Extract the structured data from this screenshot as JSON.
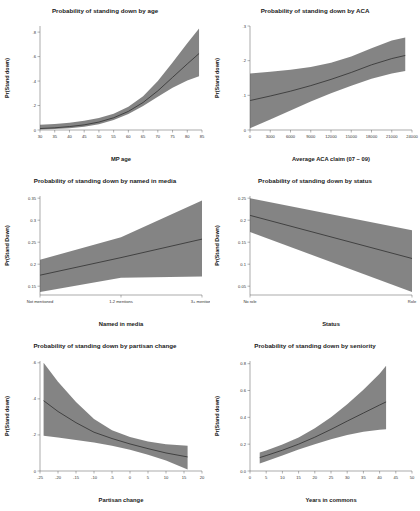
{
  "figure": {
    "background": "#ffffff",
    "band_color": "#7a7a7a",
    "line_color": "#2b2b2b",
    "axis_color": "#555555"
  },
  "chart_data": [
    {
      "id": "age",
      "type": "line",
      "title": "Probability of standing down by age",
      "xlabel": "MP age",
      "ylabel": "Pr(Stand down)",
      "xlim": [
        30,
        85
      ],
      "ylim": [
        0,
        0.85
      ],
      "xticks": [
        30,
        35,
        40,
        45,
        50,
        55,
        60,
        65,
        70,
        75,
        80,
        85
      ],
      "xticklabels": [
        "30",
        "35",
        "40",
        "45",
        "50",
        "55",
        "60",
        "65",
        "70",
        "75",
        "80",
        "85"
      ],
      "yticks": [
        0,
        0.2,
        0.4,
        0.6,
        0.8
      ],
      "yticklabels": [
        "0",
        ".2",
        ".4",
        ".6",
        ".8"
      ],
      "grid": false,
      "legend": "none",
      "x": [
        30,
        35,
        40,
        45,
        50,
        55,
        60,
        65,
        70,
        75,
        80,
        84
      ],
      "fit": [
        0.012,
        0.018,
        0.028,
        0.042,
        0.065,
        0.1,
        0.152,
        0.225,
        0.32,
        0.43,
        0.54,
        0.625
      ],
      "lower": [
        0.004,
        0.008,
        0.015,
        0.027,
        0.048,
        0.082,
        0.13,
        0.196,
        0.272,
        0.345,
        0.405,
        0.44
      ],
      "upper": [
        0.042,
        0.05,
        0.06,
        0.075,
        0.098,
        0.133,
        0.19,
        0.275,
        0.4,
        0.552,
        0.71,
        0.83
      ]
    },
    {
      "id": "aca",
      "type": "line",
      "title": "Probability of standing down by ACA",
      "xlabel": "Average ACA claim (07 − 09)",
      "ylabel": "Pr(Stand down)",
      "xlim": [
        0,
        24000
      ],
      "ylim": [
        0,
        0.3
      ],
      "xticks": [
        0,
        3000,
        6000,
        9000,
        12000,
        15000,
        18000,
        21000,
        24000
      ],
      "xticklabels": [
        "0",
        "3000",
        "6000",
        "9000",
        "12000",
        "15000",
        "18000",
        "21000",
        "24000"
      ],
      "yticks": [
        0,
        0.1,
        0.2,
        0.3
      ],
      "yticklabels": [
        "0",
        ".1",
        ".2",
        ".3"
      ],
      "grid": false,
      "legend": "none",
      "x": [
        0,
        3000,
        6000,
        9000,
        12000,
        15000,
        18000,
        21000,
        23000
      ],
      "fit": [
        0.085,
        0.098,
        0.112,
        0.128,
        0.146,
        0.166,
        0.188,
        0.206,
        0.215
      ],
      "lower": [
        0.005,
        0.03,
        0.056,
        0.082,
        0.106,
        0.128,
        0.148,
        0.163,
        0.17
      ],
      "upper": [
        0.163,
        0.168,
        0.174,
        0.182,
        0.194,
        0.212,
        0.236,
        0.258,
        0.267
      ]
    },
    {
      "id": "media",
      "type": "line",
      "title": "Probability of standing down by named in media",
      "xlabel": "Named in media",
      "ylabel": "Pr(Stand Down)",
      "xlim": [
        0,
        2
      ],
      "ylim": [
        0.13,
        0.355
      ],
      "xticks": [
        0,
        1,
        2
      ],
      "xticklabels": [
        "Not mentioned",
        "1-2 mentions",
        "3+ mentions"
      ],
      "yticks": [
        0.15,
        0.2,
        0.25,
        0.3,
        0.35
      ],
      "yticklabels": [
        "0.15",
        "0.2",
        "0.25",
        "0.3",
        "0.35"
      ],
      "grid": false,
      "legend": "none",
      "x": [
        0,
        1,
        2
      ],
      "fit": [
        0.175,
        0.215,
        0.257
      ],
      "lower": [
        0.137,
        0.169,
        0.172
      ],
      "upper": [
        0.21,
        0.261,
        0.345
      ]
    },
    {
      "id": "status",
      "type": "line",
      "title": "Probability of standing down by status",
      "xlabel": "Status",
      "ylabel": "Pr(Stand Down)",
      "xlim": [
        0,
        1
      ],
      "ylim": [
        0.03,
        0.255
      ],
      "xticks": [
        0,
        1
      ],
      "xticklabels": [
        "No role",
        "Role"
      ],
      "yticks": [
        0.05,
        0.1,
        0.15,
        0.2,
        0.25
      ],
      "yticklabels": [
        "0.05",
        "0.1",
        "0.15",
        "0.2",
        "0.25"
      ],
      "grid": false,
      "legend": "none",
      "x": [
        0,
        1
      ],
      "fit": [
        0.211,
        0.113
      ],
      "lower": [
        0.173,
        0.037
      ],
      "upper": [
        0.25,
        0.177
      ]
    },
    {
      "id": "partisan",
      "type": "line",
      "title": "Probability of standing down by partisan change",
      "xlabel": "Partisan change",
      "ylabel": "Pr(Stand down)",
      "xlim": [
        -25,
        20
      ],
      "ylim": [
        0,
        0.61
      ],
      "xticks": [
        -25,
        -20,
        -15,
        -10,
        -5,
        0,
        5,
        10,
        15,
        20
      ],
      "xticklabels": [
        "-25",
        "-20",
        "-15",
        "-10",
        "-5",
        "0",
        "5",
        "10",
        "15",
        "20"
      ],
      "yticks": [
        0,
        0.2,
        0.4,
        0.6
      ],
      "yticklabels": [
        "0",
        ".2",
        ".4",
        ".6"
      ],
      "grid": false,
      "legend": "none",
      "x": [
        -24,
        -20,
        -15,
        -10,
        -5,
        0,
        5,
        10,
        16
      ],
      "fit": [
        0.39,
        0.33,
        0.268,
        0.215,
        0.18,
        0.15,
        0.124,
        0.1,
        0.078
      ],
      "lower": [
        0.196,
        0.186,
        0.172,
        0.158,
        0.14,
        0.118,
        0.09,
        0.058,
        0.008
      ],
      "upper": [
        0.6,
        0.495,
        0.382,
        0.288,
        0.226,
        0.188,
        0.163,
        0.148,
        0.14
      ]
    },
    {
      "id": "seniority",
      "type": "line",
      "title": "Probability of standing down by seniority",
      "xlabel": "Years in commons",
      "ylabel": "Pr(Stand down)",
      "xlim": [
        0,
        50
      ],
      "ylim": [
        0,
        0.82
      ],
      "xticks": [
        0,
        5,
        10,
        15,
        20,
        25,
        30,
        35,
        40,
        45,
        50
      ],
      "xticklabels": [
        "0",
        "5",
        "10",
        "15",
        "20",
        "25",
        "30",
        "35",
        "40",
        "45",
        "50"
      ],
      "yticks": [
        0,
        0.2,
        0.4,
        0.6,
        0.8
      ],
      "yticklabels": [
        "0.0",
        "0.2",
        "0.4",
        "0.6",
        "0.8"
      ],
      "grid": false,
      "legend": "none",
      "x": [
        3,
        5,
        10,
        15,
        20,
        25,
        30,
        35,
        40,
        42
      ],
      "fit": [
        0.1,
        0.115,
        0.155,
        0.2,
        0.252,
        0.31,
        0.372,
        0.432,
        0.492,
        0.515
      ],
      "lower": [
        0.055,
        0.072,
        0.115,
        0.16,
        0.2,
        0.237,
        0.268,
        0.292,
        0.308,
        0.312
      ],
      "upper": [
        0.138,
        0.152,
        0.198,
        0.25,
        0.318,
        0.4,
        0.498,
        0.605,
        0.725,
        0.785
      ]
    }
  ]
}
